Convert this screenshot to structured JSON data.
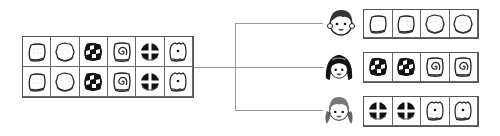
{
  "diagram": {
    "source_box": {
      "rows": [
        [
          "square-cracker",
          "round-cookie",
          "checkered-candy",
          "spiral-candy",
          "cross-candy",
          "dotted-cracker"
        ],
        [
          "square-cracker",
          "round-cookie",
          "checkered-candy",
          "spiral-candy",
          "cross-candy",
          "dotted-cracker"
        ]
      ]
    },
    "children": [
      {
        "name": "boy",
        "snacks": [
          "square-cracker",
          "square-cracker",
          "round-cookie",
          "round-cookie"
        ]
      },
      {
        "name": "girl-dark-hair",
        "snacks": [
          "checkered-candy",
          "checkered-candy",
          "spiral-candy",
          "spiral-candy"
        ]
      },
      {
        "name": "girl-pigtails",
        "snacks": [
          "cross-candy",
          "cross-candy",
          "dotted-cracker",
          "dotted-cracker"
        ]
      }
    ],
    "colors": {
      "border": "#555555",
      "connector": "#9a9a9a",
      "ink": "#111111"
    }
  }
}
